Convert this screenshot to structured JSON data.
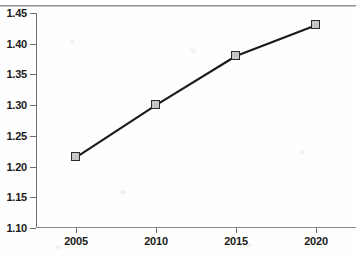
{
  "chart_data": {
    "type": "line",
    "title": "",
    "subtitle": "",
    "xlabel": "",
    "ylabel": "",
    "categories": [
      "2005",
      "2010",
      "2015",
      "2020"
    ],
    "x": [
      2005,
      2010,
      2015,
      2020
    ],
    "values": [
      1.215,
      1.3,
      1.38,
      1.43
    ],
    "series": [
      {
        "name": "",
        "values": [
          1.215,
          1.3,
          1.38,
          1.43
        ]
      }
    ],
    "ylim": [
      1.1,
      1.45
    ],
    "xlim": [
      2002.5,
      2022.5
    ],
    "yticks": [
      1.1,
      1.15,
      1.2,
      1.25,
      1.3,
      1.35,
      1.4,
      1.45
    ],
    "ytick_labels": [
      "1.10",
      "1.15",
      "1.20",
      "1.25",
      "1.30",
      "1.35",
      "1.40",
      "1.45"
    ],
    "xticks": [
      2005,
      2010,
      2015,
      2020
    ],
    "xtick_labels": [
      "2005",
      "2010",
      "2015",
      "2020"
    ],
    "grid": false,
    "legend": "none",
    "marker": "square",
    "line_color": "#1a1a1a",
    "marker_fill": "#c6c6c6",
    "marker_edge": "#2b2b2b",
    "axis_color": "#6e6e6e",
    "background": "#fefefe"
  }
}
